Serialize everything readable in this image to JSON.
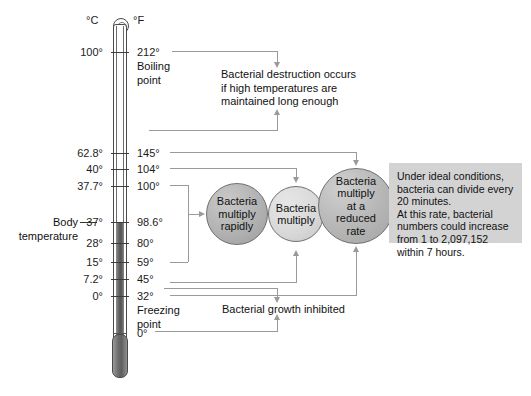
{
  "diagram": {
    "units": {
      "celsius": "°C",
      "fahrenheit": "°F"
    },
    "body_temperature_label": "Body\ntemperature",
    "scale": [
      {
        "c": "100°",
        "f": "212°",
        "f_note": "Boiling\npoint",
        "y": 52
      },
      {
        "c": "62.8°",
        "f": "145°",
        "f_note": "",
        "y": 153
      },
      {
        "c": "40°",
        "f": "104°",
        "f_note": "",
        "y": 169
      },
      {
        "c": "37.7°",
        "f": "100°",
        "f_note": "",
        "y": 186
      },
      {
        "c": "37°",
        "f": "98.6°",
        "f_note": "",
        "y": 222
      },
      {
        "c": "28°",
        "f": "80°",
        "f_note": "",
        "y": 243
      },
      {
        "c": "15°",
        "f": "59°",
        "f_note": "",
        "y": 262
      },
      {
        "c": "7.2°",
        "f": "45°",
        "f_note": "",
        "y": 279
      },
      {
        "c": "0°",
        "f": "32°",
        "f_note": "Freezing\npoint",
        "y": 296
      },
      {
        "c": "",
        "f": "0°",
        "f_note": "",
        "y": 333
      }
    ],
    "circles": [
      {
        "id": "rapid",
        "label": "Bacteria\nmultiply\nrapidly"
      },
      {
        "id": "multiply",
        "label": "Bacteria\nmultiply"
      },
      {
        "id": "reduced",
        "label": "Bacteria\nmultiply\nat a\nreduced\nrate"
      }
    ],
    "callouts": {
      "destruction": "Bacterial destruction occurs\nif high temperatures are\nmaintained long enough",
      "inhibited": "Bacterial growth inhibited"
    },
    "info_box": {
      "text": "Under ideal conditions,\nbacteria can divide every\n20 minutes.\nAt this rate, bacterial\nnumbers could increase\nfrom 1 to 2,097,152\nwithin 7 hours.",
      "background": "#d3d3d3"
    },
    "colors": {
      "line": "#9a9a9a",
      "text": "#111111",
      "tube_border": "#4a4a4a",
      "mercury": "#5f5f5f"
    }
  }
}
